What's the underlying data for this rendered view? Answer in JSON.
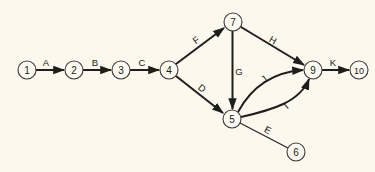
{
  "diagram": {
    "type": "activity-on-arrow network",
    "background": "#fcf8ee",
    "line_color": "#1e1e1e",
    "nodes": [
      {
        "id": "1",
        "label": "1",
        "x": 27,
        "y": 70
      },
      {
        "id": "2",
        "label": "2",
        "x": 74,
        "y": 70
      },
      {
        "id": "3",
        "label": "3",
        "x": 121,
        "y": 70
      },
      {
        "id": "4",
        "label": "4",
        "x": 169,
        "y": 70
      },
      {
        "id": "5",
        "label": "5",
        "x": 232,
        "y": 119
      },
      {
        "id": "6",
        "label": "6",
        "x": 296,
        "y": 152
      },
      {
        "id": "7",
        "label": "7",
        "x": 233,
        "y": 22
      },
      {
        "id": "9",
        "label": "9",
        "x": 313,
        "y": 70
      },
      {
        "id": "10",
        "label": "10",
        "x": 359,
        "y": 70
      }
    ],
    "edges": [
      {
        "label": "A",
        "from": "1",
        "to": "2"
      },
      {
        "label": "B",
        "from": "2",
        "to": "3"
      },
      {
        "label": "C",
        "from": "3",
        "to": "4"
      },
      {
        "label": "F",
        "from": "4",
        "to": "7"
      },
      {
        "label": "D",
        "from": "4",
        "to": "5"
      },
      {
        "label": "G",
        "from": "7",
        "to": "5"
      },
      {
        "label": "H",
        "from": "7",
        "to": "9"
      },
      {
        "label": "J",
        "from": "5",
        "to": "9"
      },
      {
        "label": "I",
        "from": "5",
        "to": "9"
      },
      {
        "label": "E",
        "from": "5",
        "to": "6"
      },
      {
        "label": "K",
        "from": "9",
        "to": "10"
      }
    ]
  }
}
